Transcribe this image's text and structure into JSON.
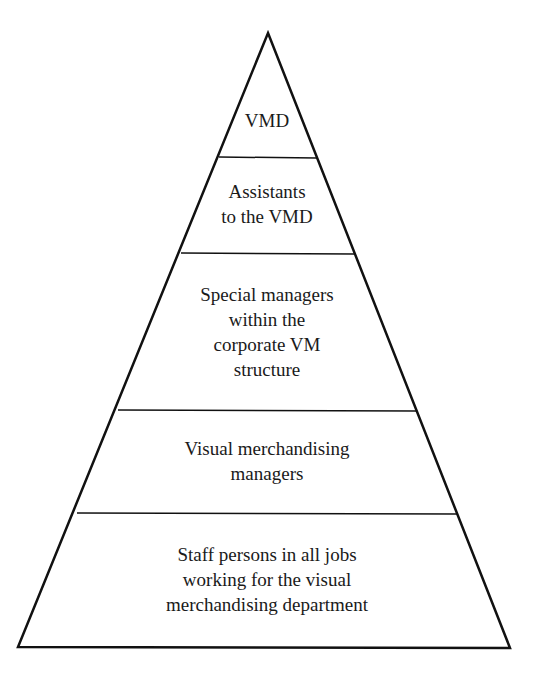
{
  "diagram": {
    "type": "pyramid",
    "colors": {
      "line": "#111111",
      "background": "#ffffff",
      "text": "#1a1a1a"
    },
    "levels": [
      {
        "label": "VMD"
      },
      {
        "label": "Assistants\nto the VMD"
      },
      {
        "label": "Special managers\nwithin the\ncorporate VM\nstructure"
      },
      {
        "label": "Visual merchandising\nmanagers"
      },
      {
        "label": "Staff persons in all jobs\nworking for the visual\nmerchandising department"
      }
    ]
  }
}
